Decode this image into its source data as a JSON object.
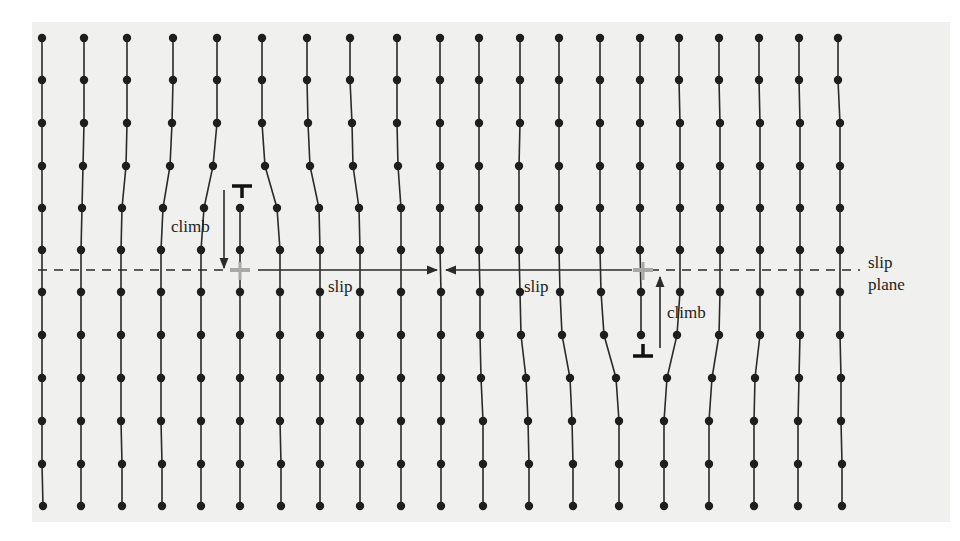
{
  "figure": {
    "panel": {
      "x": 32,
      "y": 22,
      "width": 918,
      "height": 500,
      "color": "#f0f0ee"
    },
    "colors": {
      "line": "#2a2a2a",
      "atom": "#1e1e1e",
      "ghost": "#a8a8a8"
    },
    "row_y": [
      38,
      80,
      123,
      166,
      208,
      250,
      292,
      335,
      378,
      421,
      464,
      506
    ],
    "columns": [
      {
        "id": "c1",
        "pts": [
          [
            42,
            0
          ],
          [
            42,
            1
          ],
          [
            42,
            2
          ],
          [
            42,
            3
          ],
          [
            42,
            4
          ],
          [
            42,
            5
          ],
          [
            42,
            6
          ],
          [
            42,
            7
          ],
          [
            42,
            8
          ],
          [
            42,
            9
          ],
          [
            42,
            10
          ],
          [
            43,
            11
          ]
        ]
      },
      {
        "id": "c2",
        "pts": [
          [
            84,
            0
          ],
          [
            84,
            1
          ],
          [
            84,
            2
          ],
          [
            83,
            3
          ],
          [
            82,
            4
          ],
          [
            81,
            5
          ],
          [
            81,
            6
          ],
          [
            81,
            7
          ],
          [
            81,
            8
          ],
          [
            81,
            9
          ],
          [
            81,
            10
          ],
          [
            81,
            11
          ]
        ]
      },
      {
        "id": "c3",
        "pts": [
          [
            127,
            0
          ],
          [
            127,
            1
          ],
          [
            127,
            2
          ],
          [
            126,
            3
          ],
          [
            122,
            4
          ],
          [
            121,
            5
          ],
          [
            121,
            6
          ],
          [
            121,
            7
          ],
          [
            121,
            8
          ],
          [
            121,
            9
          ],
          [
            122,
            10
          ],
          [
            122,
            11
          ]
        ]
      },
      {
        "id": "c4",
        "pts": [
          [
            173,
            0
          ],
          [
            173,
            1
          ],
          [
            172,
            2
          ],
          [
            170,
            3
          ],
          [
            163,
            4
          ],
          [
            161,
            5
          ],
          [
            161,
            6
          ],
          [
            161,
            7
          ],
          [
            161,
            8
          ],
          [
            161,
            9
          ],
          [
            162,
            10
          ],
          [
            162,
            11
          ]
        ]
      },
      {
        "id": "c5",
        "pts": [
          [
            217,
            0
          ],
          [
            217,
            1
          ],
          [
            217,
            2
          ],
          [
            213,
            3
          ],
          [
            204,
            4
          ],
          [
            201,
            5
          ],
          [
            201,
            6
          ],
          [
            201,
            7
          ],
          [
            201,
            8
          ],
          [
            201,
            9
          ],
          [
            201,
            10
          ],
          [
            201,
            11
          ]
        ]
      },
      {
        "id": "c6",
        "pts": [
          [
            240,
            4
          ],
          [
            240,
            5
          ],
          [
            240,
            6
          ],
          [
            240,
            7
          ],
          [
            240,
            8
          ],
          [
            240,
            9
          ],
          [
            240,
            10
          ],
          [
            240,
            11
          ]
        ]
      },
      {
        "id": "c7",
        "pts": [
          [
            262,
            0
          ],
          [
            262,
            1
          ],
          [
            262,
            2
          ],
          [
            265,
            3
          ],
          [
            277,
            4
          ],
          [
            280,
            5
          ],
          [
            280,
            6
          ],
          [
            280,
            7
          ],
          [
            280,
            8
          ],
          [
            280,
            9
          ],
          [
            281,
            10
          ],
          [
            281,
            11
          ]
        ]
      },
      {
        "id": "c8",
        "pts": [
          [
            307,
            0
          ],
          [
            307,
            1
          ],
          [
            308,
            2
          ],
          [
            310,
            3
          ],
          [
            319,
            4
          ],
          [
            320,
            5
          ],
          [
            320,
            6
          ],
          [
            320,
            7
          ],
          [
            320,
            8
          ],
          [
            320,
            9
          ],
          [
            320,
            10
          ],
          [
            320,
            11
          ]
        ]
      },
      {
        "id": "c9",
        "pts": [
          [
            350,
            0
          ],
          [
            350,
            1
          ],
          [
            352,
            2
          ],
          [
            353,
            3
          ],
          [
            359,
            4
          ],
          [
            360,
            5
          ],
          [
            360,
            6
          ],
          [
            360,
            7
          ],
          [
            360,
            8
          ],
          [
            360,
            9
          ],
          [
            360,
            10
          ],
          [
            360,
            11
          ]
        ]
      },
      {
        "id": "c10",
        "pts": [
          [
            397,
            0
          ],
          [
            397,
            1
          ],
          [
            397,
            2
          ],
          [
            398,
            3
          ],
          [
            401,
            4
          ],
          [
            401,
            5
          ],
          [
            401,
            6
          ],
          [
            401,
            7
          ],
          [
            401,
            8
          ],
          [
            401,
            9
          ],
          [
            401,
            10
          ],
          [
            401,
            11
          ]
        ]
      },
      {
        "id": "c11",
        "pts": [
          [
            440,
            0
          ],
          [
            440,
            1
          ],
          [
            440,
            2
          ],
          [
            440,
            3
          ],
          [
            440,
            4
          ],
          [
            440,
            5
          ],
          [
            441,
            6
          ],
          [
            441,
            7
          ],
          [
            441,
            8
          ],
          [
            441,
            9
          ],
          [
            441,
            10
          ],
          [
            441,
            11
          ]
        ]
      },
      {
        "id": "c12",
        "pts": [
          [
            479,
            0
          ],
          [
            479,
            1
          ],
          [
            479,
            2
          ],
          [
            479,
            3
          ],
          [
            479,
            4
          ],
          [
            479,
            5
          ],
          [
            480,
            6
          ],
          [
            480,
            7
          ],
          [
            481,
            8
          ],
          [
            483,
            9
          ],
          [
            483,
            10
          ],
          [
            483,
            11
          ]
        ]
      },
      {
        "id": "c13",
        "pts": [
          [
            520,
            0
          ],
          [
            520,
            1
          ],
          [
            520,
            2
          ],
          [
            519,
            3
          ],
          [
            519,
            4
          ],
          [
            519,
            5
          ],
          [
            520,
            6
          ],
          [
            521,
            7
          ],
          [
            526,
            8
          ],
          [
            528,
            9
          ],
          [
            529,
            10
          ],
          [
            529,
            11
          ]
        ]
      },
      {
        "id": "c14",
        "pts": [
          [
            559,
            0
          ],
          [
            559,
            1
          ],
          [
            559,
            2
          ],
          [
            559,
            3
          ],
          [
            559,
            4
          ],
          [
            559,
            5
          ],
          [
            560,
            6
          ],
          [
            562,
            7
          ],
          [
            570,
            8
          ],
          [
            572,
            9
          ],
          [
            573,
            10
          ],
          [
            573,
            11
          ]
        ]
      },
      {
        "id": "c15",
        "pts": [
          [
            600,
            0
          ],
          [
            600,
            1
          ],
          [
            600,
            2
          ],
          [
            600,
            3
          ],
          [
            600,
            4
          ],
          [
            600,
            5
          ],
          [
            601,
            6
          ],
          [
            604,
            7
          ],
          [
            616,
            8
          ],
          [
            619,
            9
          ],
          [
            619,
            10
          ],
          [
            619,
            11
          ]
        ]
      },
      {
        "id": "c16",
        "pts": [
          [
            640,
            0
          ],
          [
            640,
            1
          ],
          [
            640,
            2
          ],
          [
            640,
            3
          ],
          [
            640,
            4
          ],
          [
            640,
            5
          ],
          [
            641,
            6
          ],
          [
            641,
            7
          ]
        ]
      },
      {
        "id": "c17",
        "pts": [
          [
            679,
            0
          ],
          [
            679,
            1
          ],
          [
            680,
            2
          ],
          [
            680,
            3
          ],
          [
            680,
            4
          ],
          [
            680,
            5
          ],
          [
            680,
            6
          ],
          [
            677,
            7
          ],
          [
            667,
            8
          ],
          [
            664,
            9
          ],
          [
            664,
            10
          ],
          [
            664,
            11
          ]
        ]
      },
      {
        "id": "c18",
        "pts": [
          [
            719,
            0
          ],
          [
            719,
            1
          ],
          [
            720,
            2
          ],
          [
            720,
            3
          ],
          [
            720,
            4
          ],
          [
            720,
            5
          ],
          [
            720,
            6
          ],
          [
            719,
            7
          ],
          [
            712,
            8
          ],
          [
            709,
            9
          ],
          [
            709,
            10
          ],
          [
            709,
            11
          ]
        ]
      },
      {
        "id": "c19",
        "pts": [
          [
            759,
            0
          ],
          [
            759,
            1
          ],
          [
            760,
            2
          ],
          [
            760,
            3
          ],
          [
            760,
            4
          ],
          [
            760,
            5
          ],
          [
            760,
            6
          ],
          [
            760,
            7
          ],
          [
            755,
            8
          ],
          [
            754,
            9
          ],
          [
            754,
            10
          ],
          [
            754,
            11
          ]
        ]
      },
      {
        "id": "c20",
        "pts": [
          [
            799,
            0
          ],
          [
            799,
            1
          ],
          [
            800,
            2
          ],
          [
            800,
            3
          ],
          [
            800,
            4
          ],
          [
            800,
            5
          ],
          [
            800,
            6
          ],
          [
            800,
            7
          ],
          [
            799,
            8
          ],
          [
            798,
            9
          ],
          [
            798,
            10
          ],
          [
            798,
            11
          ]
        ]
      },
      {
        "id": "c21",
        "pts": [
          [
            838,
            0
          ],
          [
            838,
            1
          ],
          [
            840,
            2
          ],
          [
            840,
            3
          ],
          [
            840,
            4
          ],
          [
            840,
            5
          ],
          [
            840,
            6
          ],
          [
            840,
            7
          ],
          [
            841,
            8
          ],
          [
            841,
            9
          ],
          [
            842,
            10
          ],
          [
            842,
            11
          ]
        ]
      }
    ],
    "slip_plane": {
      "y": 270,
      "left_dash": [
        38,
        230
      ],
      "right_dash": [
        650,
        860
      ],
      "dash": "9 7"
    },
    "dislocations": [
      {
        "id": "top-left",
        "type": "positive-edge",
        "x": 242,
        "y": 186,
        "orientation": "T"
      },
      {
        "id": "bottom-right",
        "type": "negative-edge",
        "x": 643,
        "y": 356,
        "orientation": "inverted-T"
      }
    ],
    "ghost_dislocations": [
      {
        "id": "ghost-left",
        "x": 240,
        "y": 270
      },
      {
        "id": "ghost-right",
        "x": 643,
        "y": 270
      }
    ],
    "arrows": [
      {
        "id": "climb-arrow-left",
        "x1": 224,
        "y1": 190,
        "x2": 224,
        "y2": 268
      },
      {
        "id": "slip-arrow-left",
        "x1": 258,
        "y1": 270,
        "x2": 437,
        "y2": 270
      },
      {
        "id": "slip-arrow-right",
        "x1": 632,
        "y1": 270,
        "x2": 446,
        "y2": 270
      },
      {
        "id": "climb-arrow-right",
        "x1": 660,
        "y1": 348,
        "x2": 660,
        "y2": 277
      }
    ],
    "labels": {
      "climb_left": {
        "text": "climb",
        "x": 171,
        "y": 232
      },
      "slip_left": {
        "text": "slip",
        "x": 328,
        "y": 292
      },
      "slip_right": {
        "text": "slip",
        "x": 524,
        "y": 292
      },
      "climb_right": {
        "text": "climb",
        "x": 667,
        "y": 318
      },
      "slip_plane_1": {
        "text": "slip",
        "x": 868,
        "y": 268
      },
      "slip_plane_2": {
        "text": "plane",
        "x": 868,
        "y": 290
      }
    }
  }
}
